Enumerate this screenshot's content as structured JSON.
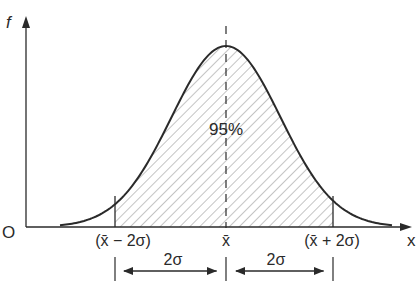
{
  "diagram": {
    "axes": {
      "y_label": "f",
      "x_label": "x",
      "origin_label": "O"
    },
    "curve": {
      "type": "normal-density",
      "shaded_area_label": "95%"
    },
    "x_marks": {
      "left": "(x̄ − 2σ)",
      "center": "x̄",
      "right": "(x̄ + 2σ)"
    },
    "dimensions": {
      "left_span": "2σ",
      "right_span": "2σ"
    },
    "colors": {
      "line": "#2a2a2a",
      "hatch": "#8a8a8a",
      "background": "#ffffff"
    }
  }
}
